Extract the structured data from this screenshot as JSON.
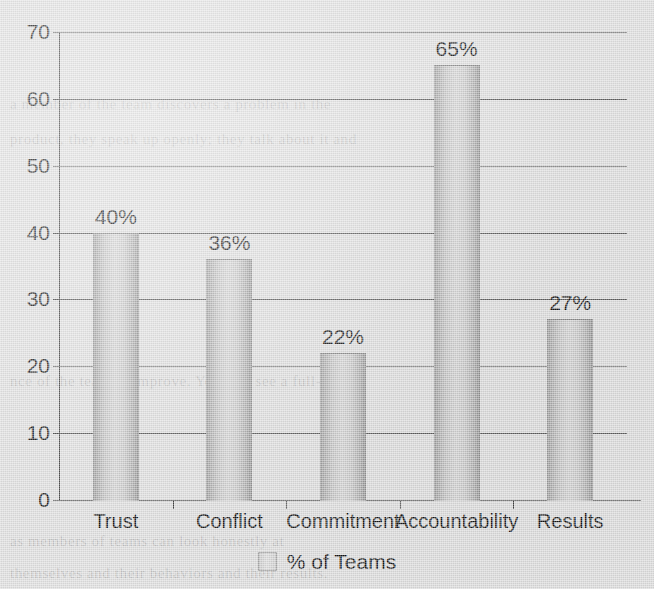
{
  "chart_data": {
    "type": "bar",
    "title": "",
    "xlabel": "",
    "ylabel": "",
    "categories": [
      "Trust",
      "Conflict",
      "Commitment",
      "Accountability",
      "Results"
    ],
    "values": [
      40,
      36,
      22,
      65,
      27
    ],
    "data_labels": [
      "40%",
      "36%",
      "22%",
      "65%",
      "27%"
    ],
    "series": [
      {
        "name": "% of Teams",
        "values": [
          40,
          36,
          22,
          65,
          27
        ]
      }
    ],
    "ylim": [
      0,
      70
    ],
    "ytick_values": [
      0,
      10,
      20,
      30,
      40,
      50,
      60,
      70
    ],
    "ytick_labels": [
      "0",
      "10",
      "20",
      "30",
      "40",
      "50",
      "60",
      "70"
    ],
    "grid": "horizontal",
    "legend_position": "bottom",
    "legend_entries": [
      "% of Teams"
    ],
    "bar_color": "#c6c6c6",
    "axis_color": "#4a4a4a",
    "background_color": "#dcdcdc"
  },
  "legend": {
    "label": "% of Teams",
    "swatch_icon": "legend-swatch-icon"
  },
  "background_text": {
    "lines": [
      "a member of the team discovers a problem in the",
      "product, they speak up openly; they talk about it and",
      "nce of the team to improve. You will see a full-scale,",
      "as members of teams can look honestly at",
      "themselves and their behaviors and their results."
    ]
  }
}
